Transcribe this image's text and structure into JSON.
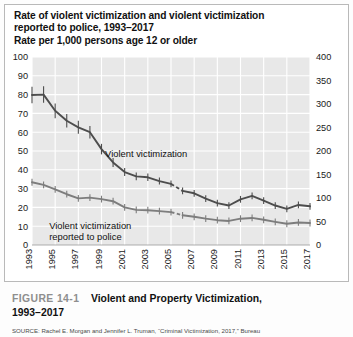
{
  "figure": {
    "title_lines": [
      "Rate of violent victimization and violent victimization",
      "reported to police, 1993–2017",
      "Rate per 1,000 persons age 12 or older"
    ],
    "caption_number": "FIGURE 14-1",
    "caption_title": "Violent and Property Victimization,",
    "caption_title_2": "1993–2017",
    "source": "SOURCE: Rachel E. Morgan and Jennifer L. Truman, “Criminal Victimization, 2017,” Bureau"
  },
  "colors": {
    "plot_background": "#e8e8e8",
    "gridline": "#ffffff",
    "axis_text": "#1a1a1a",
    "series_violent": "#4d4d4d",
    "series_reported": "#7d7d7d",
    "figure_number": "#8e8e8e",
    "card_border": "#b9b9b9"
  },
  "chart_data": {
    "type": "line",
    "title": "Rate of violent victimization and violent victimization reported to police, 1993–2017",
    "subtitle": "Rate per 1,000 persons age 12 or older",
    "xlabel": "",
    "ylabel": "Rate per 1,000 persons age 12 or older",
    "ylabel_right": "",
    "grid": true,
    "legend": "annotations-inline",
    "ylim": [
      0,
      100
    ],
    "ylim_right": [
      0,
      400
    ],
    "yticks": [
      0,
      10,
      20,
      30,
      40,
      50,
      60,
      70,
      80,
      90,
      100
    ],
    "yticks_right": [
      0,
      50,
      100,
      150,
      200,
      250,
      300,
      350,
      400
    ],
    "x": [
      1993,
      1994,
      1995,
      1996,
      1997,
      1998,
      1999,
      2000,
      2001,
      2002,
      2003,
      2004,
      2005,
      2006,
      2007,
      2008,
      2009,
      2010,
      2011,
      2012,
      2013,
      2014,
      2015,
      2016,
      2017
    ],
    "xticks": [
      1993,
      1995,
      1997,
      1999,
      2001,
      2003,
      2005,
      2007,
      2009,
      2011,
      2013,
      2015,
      2017
    ],
    "xtick_labels": [
      "1993",
      "1995",
      "1997",
      "1999",
      "2001",
      "2003",
      "2005",
      "2007",
      "2009",
      "2011",
      "2013",
      "2015",
      "2017"
    ],
    "series": [
      {
        "name": "Violent victimization",
        "color": "#4d4d4d",
        "error_bars": true,
        "break_between": [
          2005,
          2006
        ],
        "values": [
          79.8,
          80.0,
          71.4,
          66.1,
          62.6,
          60.0,
          51.0,
          43.9,
          38.8,
          36.5,
          36.0,
          34.0,
          32.5,
          28.8,
          27.5,
          24.7,
          22.3,
          21.0,
          24.3,
          26.1,
          23.6,
          21.0,
          19.2,
          21.3,
          20.6
        ]
      },
      {
        "name": "Violent victimization reported to police",
        "color": "#7d7d7d",
        "error_bars": true,
        "break_between": [
          2005,
          2006
        ],
        "values": [
          33.4,
          32.0,
          29.6,
          27.0,
          24.8,
          25.2,
          24.4,
          23.3,
          20.0,
          18.7,
          18.5,
          18.0,
          17.5,
          15.8,
          15.0,
          14.0,
          13.2,
          12.8,
          14.0,
          14.4,
          13.4,
          12.3,
          11.3,
          12.0,
          11.7
        ]
      }
    ],
    "annotations": [
      {
        "text": "Violent victimization",
        "x": 2000,
        "y": 47
      },
      {
        "text": "Violent victimization reported to police",
        "x": 1995,
        "y": 9
      }
    ]
  }
}
